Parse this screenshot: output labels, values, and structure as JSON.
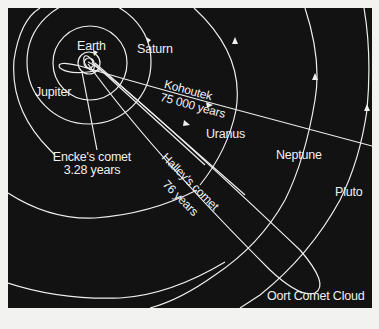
{
  "diagram": {
    "colors": {
      "background": "#121212",
      "lines": "#f0f0f0",
      "page": "#f2f2f0"
    },
    "planets": [
      {
        "name": "Earth"
      },
      {
        "name": "Jupiter"
      },
      {
        "name": "Saturn"
      },
      {
        "name": "Uranus"
      },
      {
        "name": "Neptune"
      },
      {
        "name": "Pluto"
      }
    ],
    "comets": [
      {
        "name": "Kohoutek",
        "period": "75 000 years"
      },
      {
        "name": "Encke's comet",
        "period": "3.28 years"
      },
      {
        "name": "Halley's comet",
        "period": "76 years"
      }
    ],
    "region": {
      "name": "Oort Comet Cloud"
    }
  }
}
